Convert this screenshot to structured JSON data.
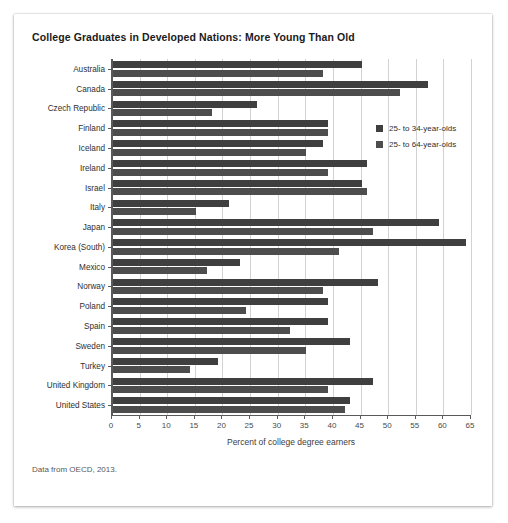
{
  "figure": {
    "title": "College Graduates in Developed Nations: More Young Than Old",
    "source_note": "Data from OECD, 2013."
  },
  "legend": {
    "position": "inside-top-right",
    "entries": [
      {
        "label": "25- to 34-year-olds",
        "color": "#3f3f3f"
      },
      {
        "label": "25- to 64-year-olds",
        "color": "#4d4d4d"
      }
    ]
  },
  "chart_data": {
    "type": "bar",
    "orientation": "horizontal",
    "title": "College Graduates in Developed Nations: More Young Than Old",
    "subtitle": "",
    "xlabel": "Percent of college degree earners",
    "ylabel": "",
    "xlim": [
      0,
      65
    ],
    "xticks": [
      0,
      5,
      10,
      15,
      20,
      25,
      30,
      35,
      40,
      45,
      50,
      55,
      60,
      65
    ],
    "xtick_labels": [
      "0",
      "5",
      "10",
      "15",
      "20",
      "25",
      "30",
      "35",
      "40",
      "45",
      "50",
      "55",
      "60",
      "65"
    ],
    "grid": true,
    "grid_axis": "x",
    "annotations": [
      "Data from OECD, 2013."
    ],
    "categories": [
      "Australia",
      "Canada",
      "Czech Republic",
      "Finland",
      "Iceland",
      "Ireland",
      "Israel",
      "Italy",
      "Japan",
      "Korea (South)",
      "Mexico",
      "Norway",
      "Poland",
      "Spain",
      "Sweden",
      "Turkey",
      "United Kingdom",
      "United States"
    ],
    "series": [
      {
        "name": "25- to 34-year-olds",
        "color": "#3f3f3f",
        "values": [
          45,
          57,
          26,
          39,
          38,
          46,
          45,
          21,
          59,
          64,
          23,
          48,
          39,
          39,
          43,
          19,
          47,
          43
        ]
      },
      {
        "name": "25- to 64-year-olds",
        "color": "#4d4d4d",
        "values": [
          38,
          52,
          18,
          39,
          35,
          39,
          46,
          15,
          47,
          41,
          17,
          38,
          24,
          32,
          35,
          14,
          39,
          42
        ]
      }
    ]
  }
}
